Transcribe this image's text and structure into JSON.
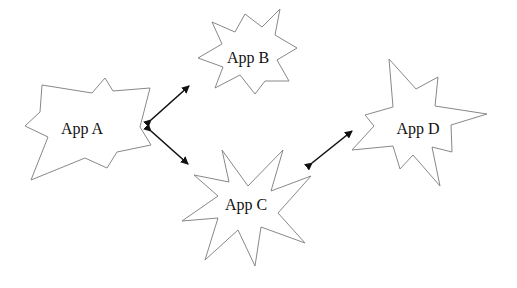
{
  "diagram": {
    "nodes": [
      {
        "id": "a",
        "label": "App A"
      },
      {
        "id": "b",
        "label": "App B"
      },
      {
        "id": "c",
        "label": "App C"
      },
      {
        "id": "d",
        "label": "App D"
      }
    ],
    "edges": [
      {
        "from": "a",
        "to": "b",
        "direction": "bidirectional"
      },
      {
        "from": "a",
        "to": "c",
        "direction": "bidirectional"
      },
      {
        "from": "c",
        "to": "d",
        "direction": "bidirectional"
      }
    ]
  },
  "colors": {
    "outline": "#888888",
    "arrow": "#111111",
    "text": "#111111",
    "background": "#ffffff"
  }
}
